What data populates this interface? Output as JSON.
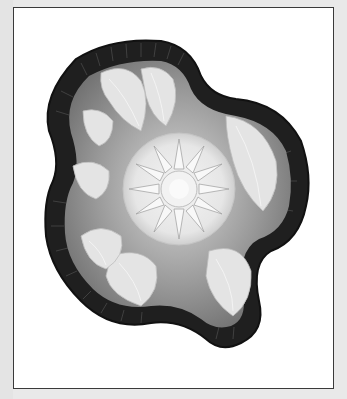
{
  "image": {
    "subject": "carnival glass bowl",
    "alt": "Grayscale photograph of a ruffled-edge cut glass bowl with a central starburst and surrounding acanthus leaf pattern",
    "colors": {
      "page_background": "#e9e9e9",
      "frame_background": "#ffffff",
      "frame_border": "#3a3a3a",
      "rim": "#1e1e1e",
      "glass_mid": "#8a8a8a",
      "leaves": "#e2e2e2",
      "center": "#f0f0f0"
    }
  }
}
